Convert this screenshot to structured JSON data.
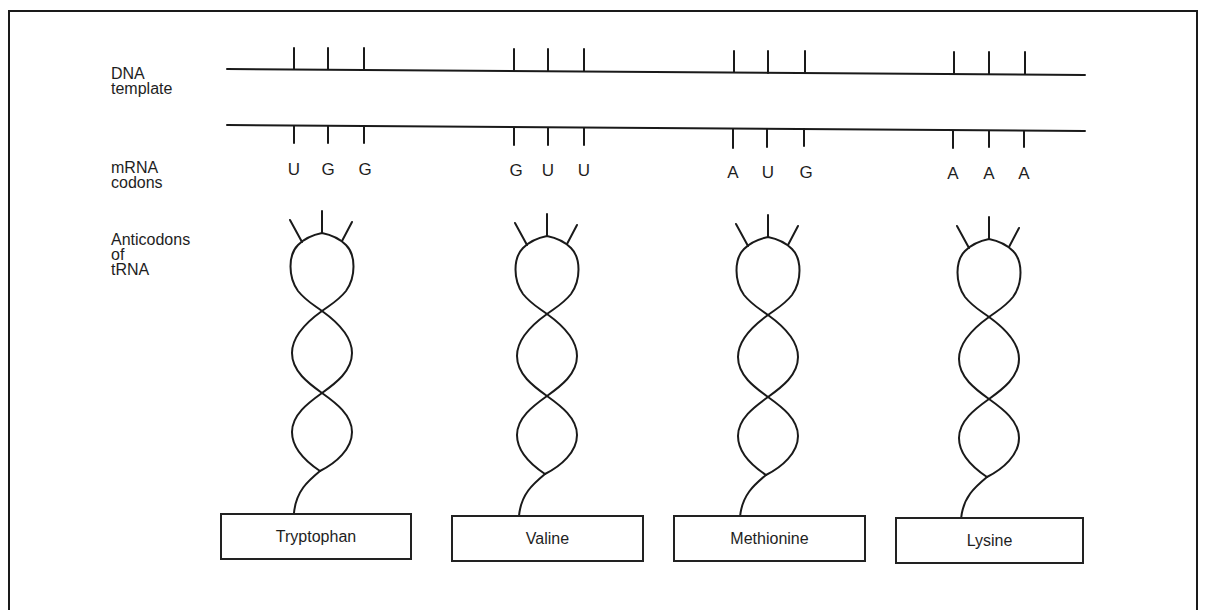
{
  "figure": {
    "row_labels": {
      "dna": "DNA\ntemplate",
      "mrna": "mRNA\ncodons",
      "trna": "Anticodons\nof\ntRNA"
    },
    "columns": [
      {
        "amino_acid": "Tryptophan",
        "codon": [
          "U",
          "G",
          "G"
        ]
      },
      {
        "amino_acid": "Valine",
        "codon": [
          "G",
          "U",
          "U"
        ]
      },
      {
        "amino_acid": "Methionine",
        "codon": [
          "A",
          "U",
          "G"
        ]
      },
      {
        "amino_acid": "Lysine",
        "codon": [
          "A",
          "A",
          "A"
        ]
      }
    ],
    "colors": {
      "stroke": "#1a1a1a",
      "background": "#ffffff"
    }
  }
}
